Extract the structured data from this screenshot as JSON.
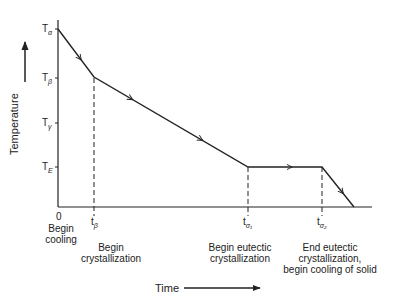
{
  "axes": {
    "y_label": "Temperature",
    "x_label": "Time",
    "origin_label": "0"
  },
  "y_ticks": [
    {
      "base": "T",
      "sub": "α",
      "y": 29
    },
    {
      "base": "T",
      "sub": "β",
      "y": 78
    },
    {
      "base": "T",
      "sub": "γ",
      "y": 123
    },
    {
      "base": "T",
      "sub": "E",
      "y": 167
    }
  ],
  "x_ticks": [
    {
      "base": "t",
      "sub": "β",
      "x": 94
    },
    {
      "base": "t",
      "sub": "σ₁",
      "x": 248
    },
    {
      "base": "t",
      "sub": "σ₂",
      "x": 322
    }
  ],
  "annotations": {
    "begin_cooling": [
      "Begin",
      "cooling"
    ],
    "begin_crystallization": [
      "Begin",
      "crystallization"
    ],
    "begin_eutectic": [
      "Begin eutectic",
      "crystallization"
    ],
    "end_eutectic": [
      "End eutectic",
      "crystallization,",
      "begin cooling of solid"
    ]
  },
  "curve_points": [
    [
      58,
      29
    ],
    [
      94,
      77
    ],
    [
      248,
      167
    ],
    [
      322,
      167
    ],
    [
      354,
      207
    ]
  ],
  "colors": {
    "line": "#222222"
  }
}
